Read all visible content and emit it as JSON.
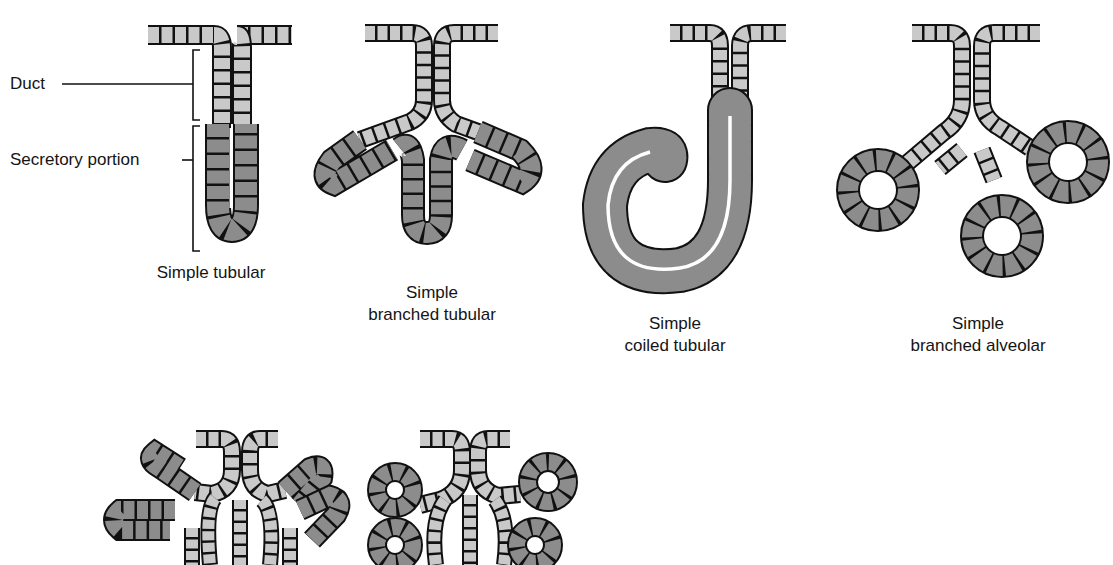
{
  "diagram": {
    "colors": {
      "duct_cell": "#c8c8c8",
      "secretory_cell": "#8a8a8a",
      "outline": "#151515",
      "background": "#ffffff"
    },
    "annotations": {
      "duct": "Duct",
      "secretory_portion": "Secretory portion"
    },
    "glands": [
      {
        "id": "simple-tubular",
        "caption_line1": "Simple tubular",
        "caption_line2": ""
      },
      {
        "id": "simple-branched-tubular",
        "caption_line1": "Simple",
        "caption_line2": "branched tubular"
      },
      {
        "id": "simple-coiled-tubular",
        "caption_line1": "Simple",
        "caption_line2": "coiled tubular"
      },
      {
        "id": "simple-branched-alveolar",
        "caption_line1": "Simple",
        "caption_line2": "branched alveolar"
      },
      {
        "id": "branched-tubular-lower",
        "caption_line1": "",
        "caption_line2": ""
      },
      {
        "id": "branched-alveolar-lower",
        "caption_line1": "",
        "caption_line2": ""
      }
    ]
  }
}
